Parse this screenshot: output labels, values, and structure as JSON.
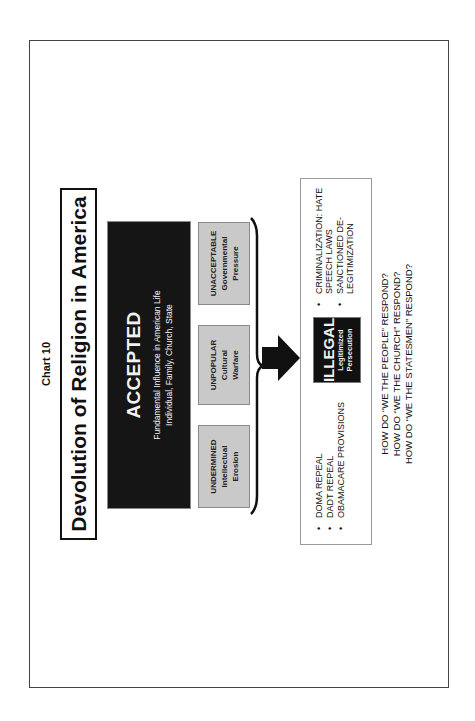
{
  "page": {
    "orientation": "rotated 90° counter-clockwise",
    "chart_label": "Chart 10",
    "title": "Devolution of Religion in America"
  },
  "accepted": {
    "heading": "ACCEPTED",
    "line1": "Fundamental Influence in American Life",
    "line2": "Individual, Family, Church, State"
  },
  "stages": [
    {
      "heading": "UNDERMINED",
      "line1": "Intellectual",
      "line2": "Erosion"
    },
    {
      "heading": "UNPOPULAR",
      "line1": "Cultural",
      "line2": "Warfare"
    },
    {
      "heading": "UNACCEPTABLE",
      "line1": "Governmental",
      "line2": "Pressure"
    }
  ],
  "illegal": {
    "heading": "ILLEGAL",
    "line1": "Legitimized",
    "line2": "Persecution"
  },
  "left_bullets": [
    "DOMA REPEAL",
    "DADT REPEAL",
    "OBAMACARE PROVISIONS"
  ],
  "right_bullets": [
    "CRIMINALIZATION: HATE SPEECH LAWS",
    "SANCTIONED DE-LEGITIMIZATION"
  ],
  "questions": [
    "HOW DO “WE THE PEOPLE” RESPOND?",
    "HOW DO “WE THE CHURCH” RESPOND?",
    "HOW DO “WE THE STATESMEN” RESPOND?"
  ],
  "colors": {
    "black_box": "#151515",
    "gray_box": "#c9c9c9",
    "frame": "#444444"
  }
}
